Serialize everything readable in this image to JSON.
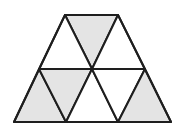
{
  "diagram": {
    "stroke_color": "#1e1e1e",
    "shaded_fill": "#e4e4e4",
    "unshaded_fill": "#ffffff",
    "stroke_width": 2,
    "triangles": [
      {
        "id": "t1",
        "points": "65,15 118,15 92,69",
        "shaded": true
      },
      {
        "id": "t2",
        "points": "65,15 39,69 92,69",
        "shaded": false
      },
      {
        "id": "t3",
        "points": "118,15 92,69 145,69",
        "shaded": false
      },
      {
        "id": "t4",
        "points": "39,69 14,122 66,122",
        "shaded": true
      },
      {
        "id": "t5",
        "points": "39,69 92,69 66,122",
        "shaded": true
      },
      {
        "id": "t6",
        "points": "92,69 66,122 118,122",
        "shaded": false
      },
      {
        "id": "t7",
        "points": "92,69 145,69 118,122",
        "shaded": false
      },
      {
        "id": "t8",
        "points": "145,69 118,122 171,122",
        "shaded": true
      }
    ],
    "outline": "65,15 118,15 171,122 14,122"
  }
}
